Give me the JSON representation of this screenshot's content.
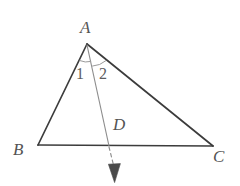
{
  "figure": {
    "kind": "geometry-diagram",
    "background_color": "#ffffff",
    "stroke_color_triangle": "#3c3c3c",
    "stroke_color_cevian": "#8e8e8e",
    "stroke_color_arc": "#9a9a9a",
    "arrow_fill_color": "#4a4a4a",
    "label_color": "#545454",
    "vertex_labels": [
      {
        "id": "label-A",
        "text": "A",
        "x": 87,
        "y": 43
      },
      {
        "id": "label-B",
        "text": "B",
        "x": 38,
        "y": 145
      },
      {
        "id": "label-C",
        "text": "C",
        "x": 213,
        "y": 146
      },
      {
        "id": "label-D",
        "text": "D",
        "x": 109,
        "y": 145
      }
    ],
    "angle_labels": [
      {
        "id": "label-angle-1",
        "text": "1"
      },
      {
        "id": "label-angle-2",
        "text": "2"
      }
    ],
    "segments": [
      {
        "name": "side-AB",
        "from": "A",
        "to": "B",
        "style": "solid"
      },
      {
        "name": "side-AC",
        "from": "A",
        "to": "C",
        "style": "solid"
      },
      {
        "name": "side-BC",
        "from": "B",
        "to": "C",
        "style": "solid"
      },
      {
        "name": "cevian-AD",
        "from": "A",
        "to": "D",
        "style": "solid"
      },
      {
        "name": "ray-D-extension",
        "from": "D",
        "to": "arrow-tip",
        "style": "dashed"
      }
    ]
  }
}
